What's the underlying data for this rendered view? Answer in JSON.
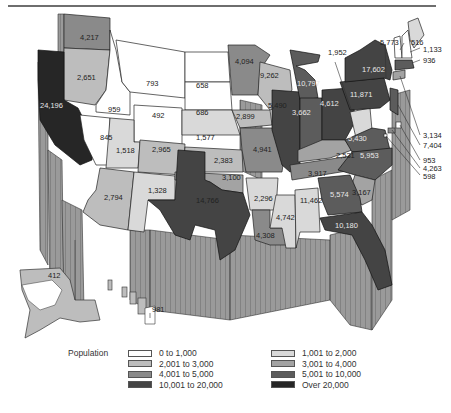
{
  "header": {
    "rule": true
  },
  "legend": {
    "title": "Population",
    "items": [
      {
        "label": "0 to 1,000",
        "color": "#ffffff"
      },
      {
        "label": "1,001 to 2,000",
        "color": "#d9d9d9"
      },
      {
        "label": "2,001 to 3,000",
        "color": "#bdbdbd"
      },
      {
        "label": "3,001 to 4,000",
        "color": "#a3a3a3"
      },
      {
        "label": "4,001 to 5,000",
        "color": "#8a8a8a"
      },
      {
        "label": "5,001 to 10,000",
        "color": "#5c5c5c"
      },
      {
        "label": "10,001 to 20,000",
        "color": "#444444"
      },
      {
        "label": "Over 20,000",
        "color": "#262626"
      }
    ]
  },
  "states": [
    {
      "name": "Washington",
      "value": "4,217"
    },
    {
      "name": "Oregon",
      "value": "2,651"
    },
    {
      "name": "California",
      "value": "24,196"
    },
    {
      "name": "Idaho",
      "value": "959"
    },
    {
      "name": "Nevada",
      "value": "845"
    },
    {
      "name": "Montana",
      "value": "793"
    },
    {
      "name": "Wyoming",
      "value": "492"
    },
    {
      "name": "Utah",
      "value": "1,518"
    },
    {
      "name": "Colorado",
      "value": "2,965"
    },
    {
      "name": "Arizona",
      "value": "2,794"
    },
    {
      "name": "New Mexico",
      "value": "1,328"
    },
    {
      "name": "North Dakota",
      "value": "658"
    },
    {
      "name": "South Dakota",
      "value": "686"
    },
    {
      "name": "Nebraska",
      "value": "1,577"
    },
    {
      "name": "Kansas",
      "value": "2,383"
    },
    {
      "name": "Oklahoma",
      "value": "3,100"
    },
    {
      "name": "Texas",
      "value": "14,766"
    },
    {
      "name": "Minnesota",
      "value": "4,094"
    },
    {
      "name": "Iowa",
      "value": "2,899"
    },
    {
      "name": "Missouri",
      "value": "4,941"
    },
    {
      "name": "Arkansas",
      "value": "2,296"
    },
    {
      "name": "Louisiana",
      "value": "4,308"
    },
    {
      "name": "Wisconsin",
      "value": "4,742"
    },
    {
      "name": "Illinois",
      "value": "11,462"
    },
    {
      "name": "Michigan",
      "value": "9,262"
    },
    {
      "name": "Indiana",
      "value": "5,490"
    },
    {
      "name": "Ohio",
      "value": "10,797"
    },
    {
      "name": "Kentucky",
      "value": "3,662"
    },
    {
      "name": "Tennessee",
      "value": "4,612"
    },
    {
      "name": "Mississippi",
      "value": "2,531"
    },
    {
      "name": "Alabama",
      "value": "3,917"
    },
    {
      "name": "Georgia",
      "value": "5,574"
    },
    {
      "name": "Florida",
      "value": "10,180"
    },
    {
      "name": "South Carolina",
      "value": "3,167"
    },
    {
      "name": "North Carolina",
      "value": "5,953"
    },
    {
      "name": "Virginia",
      "value": "5,430"
    },
    {
      "name": "West Virginia",
      "value": "1,952"
    },
    {
      "name": "Pennsylvania",
      "value": "11,871"
    },
    {
      "name": "New York",
      "value": "17,602"
    },
    {
      "name": "Vermont",
      "value": "516"
    },
    {
      "name": "New Hampshire",
      "value": "5,773"
    },
    {
      "name": "Maine",
      "value": "1,133"
    },
    {
      "name": "Massachusetts",
      "value": "936"
    },
    {
      "name": "Connecticut",
      "value": "3,134"
    },
    {
      "name": "New Jersey",
      "value": "7,404"
    },
    {
      "name": "Delaware",
      "value": "953"
    },
    {
      "name": "Maryland",
      "value": "4,263"
    },
    {
      "name": "District of Columbia",
      "value": "598"
    },
    {
      "name": "Alaska",
      "value": "412"
    },
    {
      "name": "Hawaii",
      "value": "981"
    }
  ]
}
